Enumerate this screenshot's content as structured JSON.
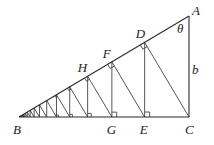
{
  "diagram": {
    "type": "geometric-construction",
    "points": {
      "A": {
        "x": 189,
        "y": 16,
        "label": "A"
      },
      "B": {
        "x": 19,
        "y": 117,
        "label": "B"
      },
      "C": {
        "x": 189,
        "y": 117,
        "label": "C"
      },
      "D": {
        "label": "D"
      },
      "E": {
        "label": "E"
      },
      "F": {
        "label": "F"
      },
      "G": {
        "label": "G"
      },
      "H": {
        "label": "H"
      }
    },
    "side_labels": {
      "b": "b",
      "theta": "θ"
    },
    "scale_factor_per_step": 0.739,
    "steps": 18,
    "colors": {
      "stroke": "#2a2a2a",
      "background": "#ffffff",
      "text": "#222222"
    }
  }
}
